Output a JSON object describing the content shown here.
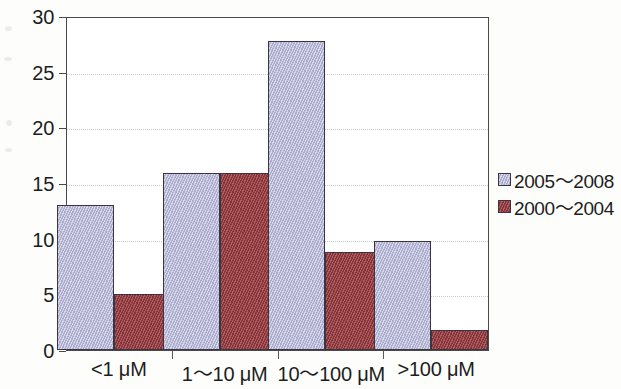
{
  "chart_data": {
    "type": "bar",
    "title": "",
    "subtitle": "",
    "xlabel": "",
    "ylabel": "",
    "categories": [
      "<1 μM",
      "1～10 μM",
      "10～100 μM",
      ">100 μM"
    ],
    "series": [
      {
        "name": "2005～2008",
        "color": "#b9bada",
        "values": [
          13,
          15.9,
          27.8,
          9.8
        ]
      },
      {
        "name": "2000～2004",
        "color": "#9e3f43",
        "values": [
          5,
          15.9,
          8.8,
          1.8
        ]
      }
    ],
    "ylim": [
      0,
      30
    ],
    "yticks": [
      0,
      5,
      10,
      15,
      20,
      25,
      30
    ],
    "ytick_labels": [
      "0",
      "5",
      "10",
      "15",
      "20",
      "25",
      "30"
    ],
    "grid": true,
    "grid_axis": "y",
    "legend_position": "right",
    "bar_group_mode": "grouped"
  },
  "figure": {
    "background_color": "#fdfdfc",
    "plot_background_color": "#ffffff",
    "frame_color": "#4a4a4a",
    "gridline_color": "#c9c9cf",
    "bar_outline_color": "#3a3540",
    "text_color": "#1d1d1d"
  }
}
